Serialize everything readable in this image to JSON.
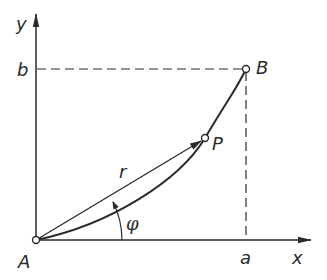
{
  "diagram": {
    "type": "polar-coordinates-curve",
    "axes": {
      "x_label": "x",
      "y_label": "y"
    },
    "points": {
      "A": {
        "label": "A",
        "role": "origin / curve start"
      },
      "P": {
        "label": "P",
        "role": "point on curve"
      },
      "B": {
        "label": "B",
        "role": "curve end"
      }
    },
    "tick_labels": {
      "a": "a",
      "b": "b"
    },
    "vector_label": "r",
    "angle_label": "φ",
    "colors": {
      "stroke": "#2a2a2a",
      "background": "#ffffff"
    }
  }
}
